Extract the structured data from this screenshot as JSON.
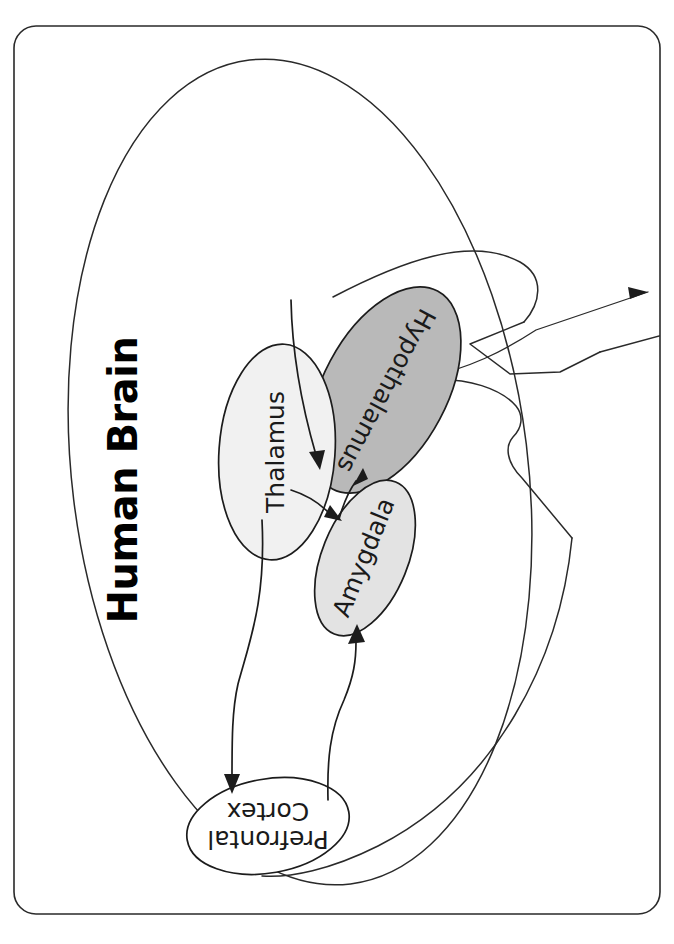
{
  "document": {
    "title": "Human Brain",
    "orientation": "rotated-90-ccw",
    "page_background": "#ffffff"
  },
  "figure": {
    "title": "Human Brain",
    "caption": "",
    "border": {
      "style": "rounded-rectangle",
      "color": "#2a2a2a"
    },
    "structures": [
      {
        "id": "thalamus",
        "label": "Thalamus",
        "fill": "#f1f1f1",
        "stroke": "#1c1c1c",
        "shape": "ellipse"
      },
      {
        "id": "hypothalamus",
        "label": "Hypothalamus",
        "fill": "#b9b9b9",
        "stroke": "#1c1c1c",
        "shape": "ellipse"
      },
      {
        "id": "amygdala",
        "label": "Amygdala",
        "fill": "#e3e3e3",
        "stroke": "#1c1c1c",
        "shape": "ellipse"
      },
      {
        "id": "prefrontal-cortex",
        "label_line1": "Prefrontal",
        "label_line2": "Cortex",
        "label": "Prefrontal Cortex",
        "fill": "#ffffff",
        "stroke": "#1c1c1c",
        "shape": "ellipse"
      }
    ],
    "connections": [
      {
        "from": "hypothalamus",
        "to": "thalamus",
        "arrow": true
      },
      {
        "from": "thalamus",
        "to": "amygdala",
        "arrow": true
      },
      {
        "from": "amygdala",
        "to": "hypothalamus",
        "arrow": true
      },
      {
        "from": "thalamus",
        "to": "prefrontal-cortex",
        "arrow": true
      },
      {
        "from": "prefrontal-cortex",
        "to": "amygdala",
        "arrow": true
      }
    ],
    "leader_lines": [
      {
        "id": "brainstem-pointer",
        "arrow": true
      }
    ],
    "brain_outline": {
      "description": "cerebrum-outline",
      "stroke": "#2a2a2a"
    }
  }
}
